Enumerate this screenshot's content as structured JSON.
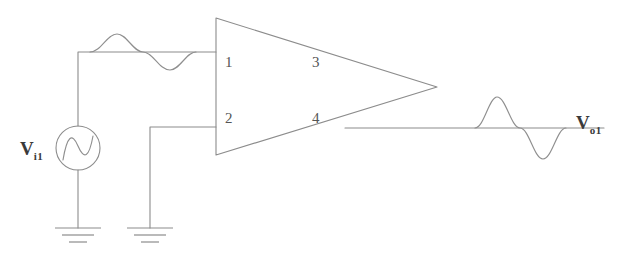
{
  "diagram": {
    "background_color": "#ffffff",
    "line_color": "#8c8c8c",
    "text_color": "#3a3a3a"
  },
  "opamp": {
    "name": "operational-amplifier",
    "pins": [
      {
        "number": "1",
        "role": "inverting-input",
        "x": 225,
        "y": 55
      },
      {
        "number": "2",
        "role": "non-inverting-input",
        "x": 225,
        "y": 111
      },
      {
        "number": "3",
        "role": "internal-upper",
        "x": 312,
        "y": 55
      },
      {
        "number": "4",
        "role": "internal-lower",
        "x": 312,
        "y": 111
      }
    ]
  },
  "source": {
    "name": "ac-voltage-source",
    "label_main": "V",
    "label_sub": "i1",
    "symbol": "sine-source-circle"
  },
  "output": {
    "name": "output-node",
    "label_main": "V",
    "label_sub": "o1"
  },
  "waveforms": {
    "input": {
      "name": "input-sine-waveform",
      "amplitude": 18,
      "baseline_y": 52,
      "x_start": 90,
      "x_end": 196,
      "cycles": 1
    },
    "output": {
      "name": "output-sine-waveform",
      "amplitude": 31,
      "baseline_y": 128,
      "x_start": 475,
      "x_end": 566,
      "cycles": 1
    }
  },
  "grounds": [
    {
      "name": "ground-source",
      "x": 78,
      "y": 228
    },
    {
      "name": "ground-noninverting",
      "x": 150,
      "y": 228
    }
  ]
}
